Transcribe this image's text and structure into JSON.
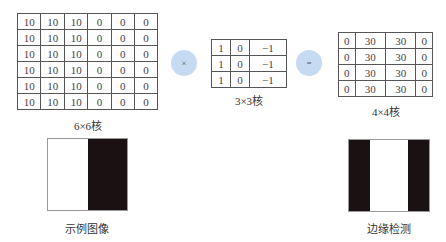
{
  "input_matrix": {
    "label": "6×6核",
    "rows": [
      [
        "10",
        "10",
        "10",
        "0",
        "0",
        "0"
      ],
      [
        "10",
        "10",
        "10",
        "0",
        "0",
        "0"
      ],
      [
        "10",
        "10",
        "10",
        "0",
        "0",
        "0"
      ],
      [
        "10",
        "10",
        "10",
        "0",
        "0",
        "0"
      ],
      [
        "10",
        "10",
        "10",
        "0",
        "0",
        "0"
      ],
      [
        "10",
        "10",
        "10",
        "0",
        "0",
        "0"
      ]
    ]
  },
  "operator_multiply": "×",
  "kernel_matrix": {
    "label": "3×3核",
    "rows": [
      [
        "1",
        "0",
        "−1"
      ],
      [
        "1",
        "0",
        "−1"
      ],
      [
        "1",
        "0",
        "−1"
      ]
    ]
  },
  "operator_equals": "=",
  "output_matrix": {
    "label": "4×4核",
    "rows": [
      [
        "0",
        "30",
        "30",
        "0"
      ],
      [
        "0",
        "30",
        "30",
        "0"
      ],
      [
        "0",
        "30",
        "30",
        "0"
      ],
      [
        "0",
        "30",
        "30",
        "0"
      ]
    ]
  },
  "sample_image": {
    "label": "示例图像",
    "segments": [
      {
        "color": "#ffffff",
        "width": 40
      },
      {
        "color": "#1a1212",
        "width": 40
      }
    ]
  },
  "edge_image": {
    "label": "边缘检测",
    "segments": [
      {
        "color": "#1a1212",
        "width": 21
      },
      {
        "color": "#ffffff",
        "width": 39
      },
      {
        "color": "#1a1212",
        "width": 21
      }
    ]
  },
  "colors": {
    "operator_circle": "#c6dbf1"
  }
}
